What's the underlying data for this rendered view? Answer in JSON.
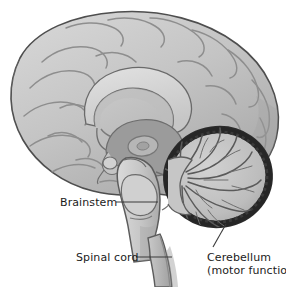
{
  "figure": {
    "background_color": "#ffffff",
    "ink_color": "#1b1b1b",
    "palette": {
      "cortex_light": "#cfcfcf",
      "cortex_mid": "#b8b8b8",
      "cortex_shadow": "#9a9a9a",
      "outline": "#4a4a4a",
      "corpus_callosum": "#d8d8d8",
      "deep_structures": "#8e8e8e",
      "brainstem": "#c9c9c9",
      "cerebellum_interior": "#c2c2c2",
      "cerebellum_rim": "#2e2e2e",
      "spinal_cord": "#bdbdbd",
      "leader_line": "#3a3a3a"
    }
  },
  "labels": [
    {
      "id": "brainstem",
      "text": "Brainstem",
      "sub": "",
      "leader": "horizontal-right"
    },
    {
      "id": "spinal-cord",
      "text": "Spinal cord",
      "sub": "",
      "leader": "horizontal-right"
    },
    {
      "id": "cerebellum",
      "text": "Cerebellum",
      "sub": "(motor function)",
      "leader": "diagonal-up-left"
    }
  ],
  "structures": [
    "cerebral cortex",
    "corpus callosum",
    "thalamus",
    "midbrain",
    "pons",
    "medulla oblongata",
    "cerebellum",
    "spinal cord"
  ]
}
